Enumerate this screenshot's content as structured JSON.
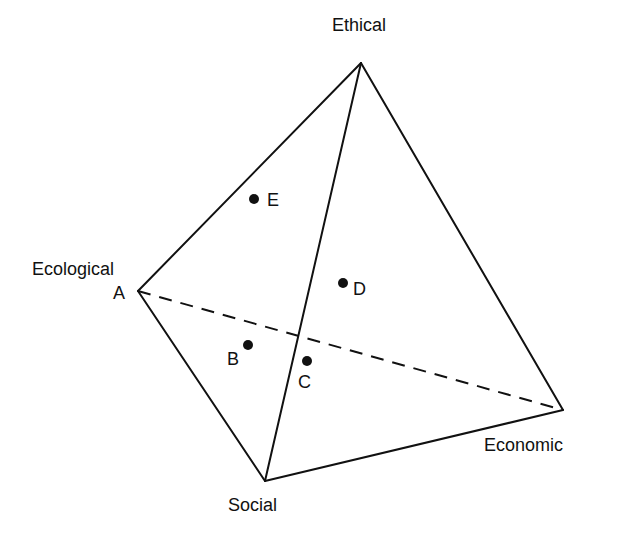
{
  "diagram": {
    "type": "tetrahedron",
    "colors": {
      "line": "#111111",
      "background": "#ffffff"
    },
    "vertices": {
      "ethical": {
        "label": "Ethical",
        "x": 361,
        "y": 63
      },
      "ecological": {
        "label": "Ecological",
        "letter": "A",
        "x": 138,
        "y": 291
      },
      "economic": {
        "label": "Economic",
        "x": 563,
        "y": 410
      },
      "social": {
        "label": "Social",
        "x": 265,
        "y": 481
      }
    },
    "points": [
      {
        "label": "E",
        "x": 254,
        "y": 199
      },
      {
        "label": "D",
        "x": 343,
        "y": 283
      },
      {
        "label": "B",
        "x": 248,
        "y": 345
      },
      {
        "label": "C",
        "x": 307,
        "y": 361
      }
    ],
    "hidden_edge": {
      "from": "ecological",
      "to": "economic",
      "style": "dashed"
    }
  }
}
